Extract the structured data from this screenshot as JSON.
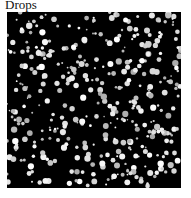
{
  "caption": "Drops",
  "image": {
    "description": "black field with scattered white/grey droplets",
    "background_color": "#000000",
    "drop_color": "#e8e8e8",
    "drop_count": 420,
    "seed": 7
  }
}
